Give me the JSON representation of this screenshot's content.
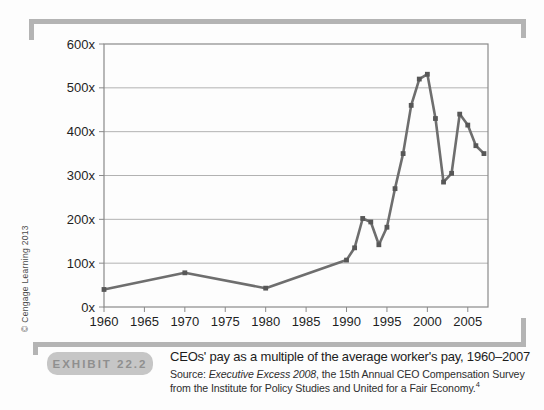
{
  "colors": {
    "frame": "#b4b4b4",
    "badge_bg": "#c6c6c6",
    "badge_text": "#8f8f8f"
  },
  "copyright_vertical": "© Cengage Learning 2013",
  "exhibit": {
    "badge_label": "EXHIBIT 22.2",
    "title": "CEOs' pay as a multiple of the average worker's pay, 1960–2007",
    "source_prefix": "Source: ",
    "source_publication": "Executive Excess 2008",
    "source_rest": ", the 15th Annual CEO Compensation Survey from the Institute for Policy Studies and United for a Fair Economy.",
    "source_footnote": "4"
  },
  "chart_data": {
    "type": "line",
    "title": "",
    "xlabel": "",
    "ylabel": "",
    "xlim": [
      1960,
      2007.5
    ],
    "ylim": [
      0,
      600
    ],
    "grid": true,
    "legend": "none",
    "series": [
      {
        "name": "CEO pay as a multiple of average worker pay",
        "x": [
          1960,
          1970,
          1980,
          1990,
          1991,
          1992,
          1993,
          1994,
          1995,
          1996,
          1997,
          1998,
          1999,
          2000,
          2001,
          2002,
          2003,
          2004,
          2005,
          2006,
          2007
        ],
        "values": [
          40,
          78,
          43,
          107,
          135,
          202,
          194,
          142,
          182,
          270,
          350,
          460,
          520,
          531,
          430,
          285,
          305,
          440,
          415,
          368,
          350
        ]
      }
    ],
    "x_ticks": [
      {
        "v": 1960,
        "label": "1960"
      },
      {
        "v": 1965,
        "label": "1965"
      },
      {
        "v": 1970,
        "label": "1970"
      },
      {
        "v": 1975,
        "label": "1975"
      },
      {
        "v": 1980,
        "label": "1980"
      },
      {
        "v": 1985,
        "label": "1985"
      },
      {
        "v": 1990,
        "label": "1990"
      },
      {
        "v": 1995,
        "label": "1995"
      },
      {
        "v": 2000,
        "label": "2000"
      },
      {
        "v": 2005,
        "label": "2005"
      }
    ],
    "y_ticks": [
      {
        "v": 0,
        "label": "0x"
      },
      {
        "v": 100,
        "label": "100x"
      },
      {
        "v": 200,
        "label": "200x"
      },
      {
        "v": 300,
        "label": "300x"
      },
      {
        "v": 400,
        "label": "400x"
      },
      {
        "v": 500,
        "label": "500x"
      },
      {
        "v": 600,
        "label": "600x"
      }
    ],
    "colors": {
      "line": "#6e6e6e",
      "marker": "#575757",
      "grid": "#b2b2b2",
      "border": "#8a8a8a",
      "tick_text": "#1f1f1f"
    }
  }
}
